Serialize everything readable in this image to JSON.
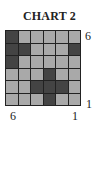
{
  "title": "CHART 2",
  "grid": {
    "rows": 6,
    "cols": 6,
    "cells": [
      [
        "dark",
        "light",
        "light",
        "light",
        "light",
        "light"
      ],
      [
        "dark",
        "dark",
        "light",
        "light",
        "light",
        "dark"
      ],
      [
        "dark",
        "light",
        "light",
        "light",
        "light",
        "light"
      ],
      [
        "light",
        "light",
        "light",
        "dark",
        "light",
        "light"
      ],
      [
        "light",
        "light",
        "dark",
        "dark",
        "dark",
        "light"
      ],
      [
        "light",
        "light",
        "light",
        "dark",
        "light",
        "light"
      ]
    ],
    "colors": {
      "dark": "#444444",
      "light": "#a9a9a9",
      "line": "#222222"
    }
  },
  "labels": {
    "right_top": "6",
    "right_bottom": "1",
    "bottom_left": "6",
    "bottom_right": "1"
  }
}
